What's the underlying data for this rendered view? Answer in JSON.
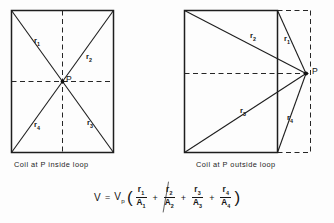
{
  "figure": {
    "title_absent": true,
    "panels": [
      {
        "id": "left",
        "caption": "Coil at P inside loop",
        "point_label": "P",
        "radius_labels": [
          "r",
          "r",
          "r",
          "r"
        ],
        "radius_subscripts": [
          "1",
          "2",
          "3",
          "4"
        ]
      },
      {
        "id": "right",
        "caption": "Coil at P outside loop",
        "point_label": "P",
        "radius_labels": [
          "r",
          "r",
          "r",
          "r"
        ],
        "radius_subscripts": [
          "1",
          "2",
          "3",
          "4"
        ]
      }
    ]
  },
  "labels": {
    "left": {
      "r1": "r",
      "r1sub": "1",
      "r2": "r",
      "r2sub": "2",
      "r3": "r",
      "r3sub": "3",
      "r4": "r",
      "r4sub": "4",
      "p": "P"
    },
    "right": {
      "r1": "r",
      "r1sub": "1",
      "r2": "r",
      "r2sub": "2",
      "r3": "r",
      "r3sub": "3",
      "r4": "r",
      "r4sub": "4",
      "p": "P"
    }
  },
  "formula": {
    "lhs": "V",
    "equals": "=",
    "coefficient": "V",
    "coefficient_sub": "p",
    "open_paren": "(",
    "close_paren": ")",
    "plus": "+",
    "terms": [
      {
        "num": "r",
        "num_sub": "1",
        "den": "A",
        "den_sub": "1"
      },
      {
        "num": "r",
        "num_sub": "2",
        "den": "A",
        "den_sub": "2"
      },
      {
        "num": "r",
        "num_sub": "3",
        "den": "A",
        "den_sub": "3"
      },
      {
        "num": "r",
        "num_sub": "4",
        "den": "A",
        "den_sub": "4"
      }
    ],
    "plain_text": "V = Vp ( r1/A1 + r2/A2 + r3/A3 + r4/A4 )"
  },
  "colors": {
    "background": "#fdfdfd",
    "line": "#1e1e1e",
    "dashed": "#2a2a2a",
    "text": "#141414"
  }
}
